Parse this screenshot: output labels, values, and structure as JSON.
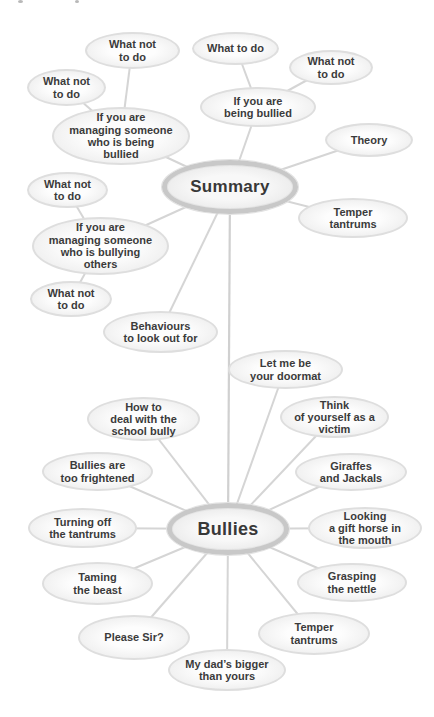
{
  "diagram": {
    "type": "mind-map",
    "colors": {
      "background": "#ffffff",
      "node_fill": "#f7f7f7",
      "node_border": "#dedede",
      "hub_border": "#c8c8c8",
      "connector": "#d5d5d5",
      "text": "#3b3b3b"
    },
    "hubs": [
      {
        "id": "summary",
        "label": "Summary"
      },
      {
        "id": "bullies",
        "label": "Bullies"
      }
    ],
    "summary_nodes": [
      {
        "label": "What not\nto do"
      },
      {
        "label": "What to do"
      },
      {
        "label": "What not\nto do"
      },
      {
        "label": "What not\nto do"
      },
      {
        "label": "If you are\nmanaging someone\nwho is being\nbullied"
      },
      {
        "label": "If you are\nbeing bullied"
      },
      {
        "label": "Theory"
      },
      {
        "label": "What not\nto do"
      },
      {
        "label": "Temper\ntantrums"
      },
      {
        "label": "If you are\nmanaging someone\nwho is bullying\nothers"
      },
      {
        "label": "What not\nto do"
      },
      {
        "label": "Behaviours\nto look out for"
      }
    ],
    "bullies_nodes": [
      {
        "label": "Let me be\nyour doormat"
      },
      {
        "label": "How to\ndeal with the\nschool bully"
      },
      {
        "label": "Think\nof yourself as a\nvictim"
      },
      {
        "label": "Bullies are\ntoo frightened"
      },
      {
        "label": "Giraffes\nand Jackals"
      },
      {
        "label": "Turning off\nthe tantrums"
      },
      {
        "label": "Looking\na gift horse in\nthe mouth"
      },
      {
        "label": "Taming\nthe beast"
      },
      {
        "label": "Grasping\nthe nettle"
      },
      {
        "label": "Please Sir?"
      },
      {
        "label": "Temper\ntantrums"
      },
      {
        "label": "My dad’s bigger\nthan yours"
      }
    ]
  }
}
